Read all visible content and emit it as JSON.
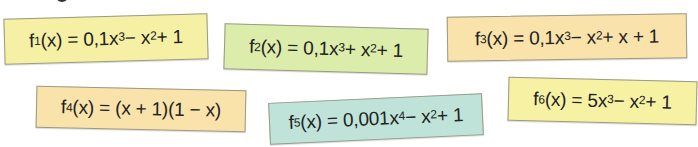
{
  "colors": {
    "yellow": "#f7f1a6",
    "green": "#dcecaa",
    "orange": "#f8e2a8",
    "teal": "#bde2d7",
    "text": "#222222"
  },
  "cards": [
    {
      "id": "f1",
      "color": "#f6f0a4",
      "name": "f",
      "index": "1",
      "arg": "(x)",
      "equals": "=",
      "parts": [
        "0,1x",
        "3",
        " − x",
        "2",
        " + 1"
      ]
    },
    {
      "id": "f2",
      "color": "#dcecab",
      "name": "f",
      "index": "2",
      "arg": "(x)",
      "equals": "=",
      "parts": [
        "0,1x",
        "3",
        " + x",
        "2",
        " + 1"
      ]
    },
    {
      "id": "f3",
      "color": "#f9e3aa",
      "name": "f",
      "index": "3",
      "arg": "(x)",
      "equals": "=",
      "parts": [
        "0,1x",
        "3",
        " − x",
        "2",
        " + x + 1"
      ]
    },
    {
      "id": "f4",
      "color": "#f9e3aa",
      "name": "f",
      "index": "4",
      "arg": "(x)",
      "equals": "=",
      "expression": "(x + 1)(1 − x)"
    },
    {
      "id": "f5",
      "color": "#bfe3d8",
      "name": "f",
      "index": "5",
      "arg": "(x)",
      "equals": "=",
      "parts": [
        "0,001x",
        "4",
        " − x",
        "2",
        " + 1"
      ]
    },
    {
      "id": "f6",
      "color": "#f7f1a4",
      "name": "f",
      "index": "6",
      "arg": "(x)",
      "equals": "=",
      "parts": [
        "5x",
        "3",
        " − x",
        "2",
        " + 1"
      ]
    }
  ]
}
